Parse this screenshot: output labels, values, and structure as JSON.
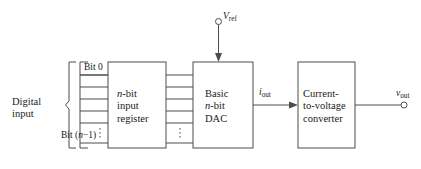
{
  "figure": {
    "type": "block-diagram",
    "background_color": "#ffffff",
    "line_color": "#4d4d4d",
    "text_color": "#1a1a1a"
  },
  "input_section": {
    "group_label_line1": "Digital",
    "group_label_line2": "input",
    "bit_first_label": "Bit 0",
    "bit_last_prefix": "Bit",
    "bit_last_index": "(n−1)",
    "bit_last_index_italic_char": "n",
    "line_count": 5,
    "has_vertical_ellipsis": true
  },
  "blocks": [
    {
      "id": "input-register",
      "lines": [
        "n-bit",
        "input",
        "register"
      ],
      "italic_first_char": "n"
    },
    {
      "id": "basic-dac",
      "lines": [
        "Basic",
        "n-bit",
        "DAC"
      ],
      "italic_first_char": "n"
    },
    {
      "id": "current-to-voltage-converter",
      "lines": [
        "Current-",
        "to-voltage",
        "converter"
      ]
    }
  ],
  "terminals": {
    "vref": {
      "symbol": "V",
      "subscript": "ref",
      "position": "top"
    },
    "vout": {
      "symbol": "v",
      "subscript": "out",
      "position": "right"
    }
  },
  "signals": {
    "iout": {
      "symbol": "i",
      "subscript": "out"
    }
  }
}
